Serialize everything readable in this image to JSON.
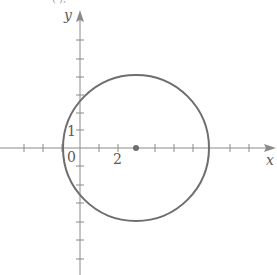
{
  "figure": {
    "top_fragment": "(        ),",
    "axes": {
      "x_label": "x",
      "y_label": "y",
      "origin_label": "0",
      "x_tick_label": "2",
      "y_tick_label": "1"
    },
    "colors": {
      "axis": "#8a8a8a",
      "circle": "#6e6e6e",
      "text": "#5a5a5a",
      "background": "#ffffff"
    },
    "circle": {
      "center": [
        3,
        0
      ],
      "radius": 4
    },
    "x_range": [
      -4,
      10
    ],
    "y_range": [
      -7,
      7
    ]
  }
}
